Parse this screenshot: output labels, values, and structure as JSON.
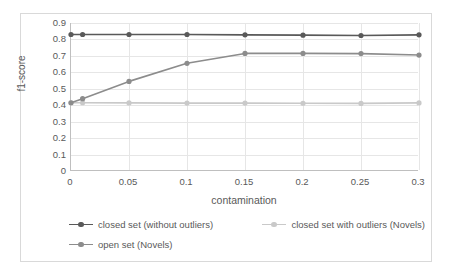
{
  "chart_data": {
    "type": "line",
    "title": "",
    "xlabel": "contamination",
    "ylabel": "f1-score",
    "x": [
      0,
      0.01,
      0.05,
      0.1,
      0.15,
      0.2,
      0.25,
      0.3
    ],
    "xtick_labels": [
      "0",
      "0.05",
      "0.1",
      "0.15",
      "0.2",
      "0.25",
      "0.3"
    ],
    "xtick_values": [
      0,
      0.05,
      0.1,
      0.15,
      0.2,
      0.25,
      0.3
    ],
    "ytick_labels": [
      "0.9",
      "0.8",
      "0.7",
      "0.6",
      "0.5",
      "0.4",
      "0.3",
      "0.2",
      "0.1",
      "0"
    ],
    "ytick_values": [
      0.9,
      0.8,
      0.7,
      0.6,
      0.5,
      0.4,
      0.3,
      0.2,
      0.1,
      0
    ],
    "ylim": [
      0,
      0.9
    ],
    "xlim": [
      0,
      0.3
    ],
    "grid": "horizontal-and-vertical",
    "legend_position": "bottom",
    "markers": "circle",
    "series": [
      {
        "name": "closed set (without outliers)",
        "color": "#595959",
        "values": [
          0.83,
          0.83,
          0.83,
          0.83,
          0.828,
          0.826,
          0.824,
          0.828
        ]
      },
      {
        "name": "closed set with outliers  (Novels)",
        "color": "#c9c9c9",
        "values": [
          0.415,
          0.415,
          0.414,
          0.413,
          0.413,
          0.412,
          0.411,
          0.414
        ]
      },
      {
        "name": "open set (Novels)",
        "color": "#8c8c8c",
        "values": [
          0.415,
          0.44,
          0.545,
          0.655,
          0.715,
          0.715,
          0.714,
          0.705
        ]
      }
    ]
  },
  "legend": {
    "entries": [
      {
        "label": "closed set (without outliers)"
      },
      {
        "label": "closed set with outliers  (Novels)"
      },
      {
        "label": "open set (Novels)"
      }
    ]
  },
  "colors": {
    "series_dark": "#595959",
    "series_mid": "#8c8c8c",
    "series_light": "#c9c9c9",
    "gridline": "#e6e6e6",
    "axis": "#bfbfbf",
    "frame_border": "#d9d9d9",
    "text": "#595959",
    "background": "#ffffff"
  }
}
